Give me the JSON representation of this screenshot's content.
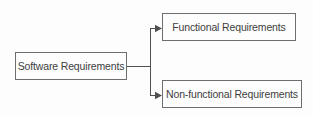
{
  "diagram": {
    "type": "hierarchy",
    "root": {
      "label": "Software Requirements"
    },
    "children": [
      {
        "label": "Functional Requirements"
      },
      {
        "label": "Non-functional Requirements"
      }
    ],
    "colors": {
      "background": "#fdfdfd",
      "box_border": "#6e6e6e",
      "text": "#3e3e3e",
      "connector": "#4f4f4f"
    }
  }
}
